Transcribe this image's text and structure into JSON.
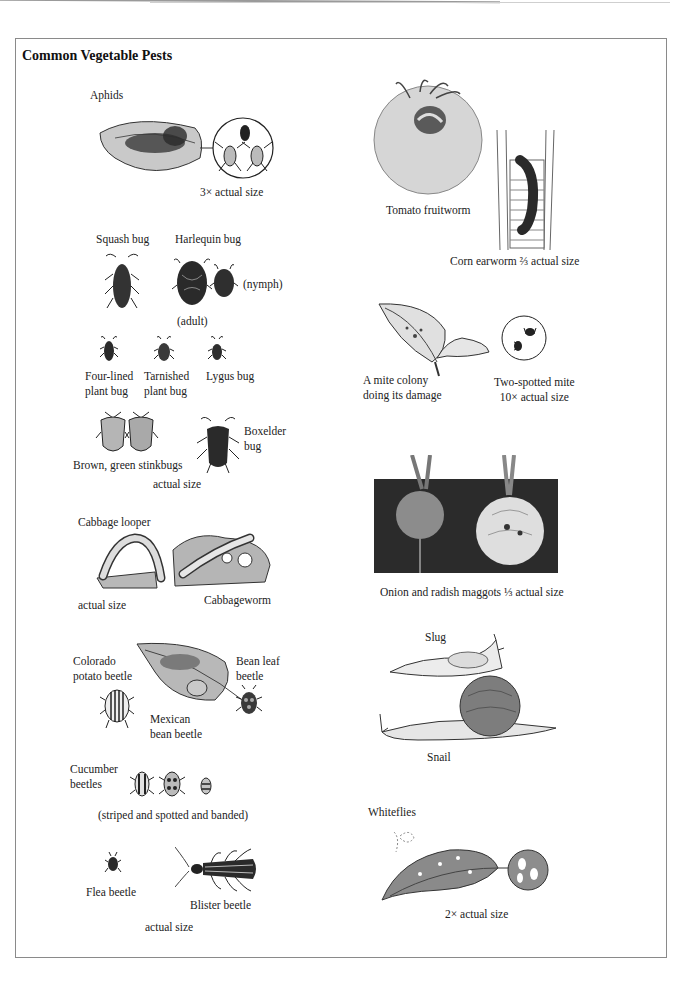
{
  "page": {
    "title": "Common Vegetable Pests"
  },
  "left_column": {
    "aphids": {
      "name": "Aphids",
      "scale": "3× actual size"
    },
    "bugs": {
      "squash_bug": "Squash bug",
      "harlequin_bug": "Harlequin bug",
      "nymph": "(nymph)",
      "adult": "(adult)",
      "four_lined_line1": "Four-lined",
      "four_lined_line2": "plant bug",
      "tarnished_line1": "Tarnished",
      "tarnished_line2": "plant bug",
      "lygus_bug": "Lygus bug",
      "boxelder_line1": "Boxelder",
      "boxelder_line2": "bug",
      "stinkbugs": "Brown, green stinkbugs",
      "scale": "actual size"
    },
    "caterpillars": {
      "cabbage_looper": "Cabbage looper",
      "scale": "actual size",
      "cabbageworm": "Cabbageworm"
    },
    "beetles": {
      "colorado_line1": "Colorado",
      "colorado_line2": "potato beetle",
      "bean_leaf_line1": "Bean leaf",
      "bean_leaf_line2": "beetle",
      "mexican_line1": "Mexican",
      "mexican_line2": "bean beetle",
      "cucumber_line1": "Cucumber",
      "cucumber_line2": "beetles",
      "cucumber_note": "(striped and spotted and banded)",
      "flea_beetle": "Flea beetle",
      "blister_beetle": "Blister beetle",
      "scale": "actual size"
    }
  },
  "right_column": {
    "tomato_fruitworm": "Tomato fruitworm",
    "corn_earworm": "Corn earworm ⅔ actual size",
    "mite_colony_line1": "A mite colony",
    "mite_colony_line2": "doing its damage",
    "two_spotted_line1": "Two-spotted mite",
    "two_spotted_line2": "10× actual size",
    "maggots": "Onion and radish maggots ⅓ actual size",
    "slug": "Slug",
    "snail": "Snail",
    "whiteflies": "Whiteflies",
    "whiteflies_scale": "2× actual size"
  },
  "colors": {
    "ink": "#1e1e1e",
    "frame": "#8a8a8a",
    "tomato_fill": "#d8d8d8",
    "leaf_fill": "#bdbdbd",
    "soil_fill": "#2b2b2b"
  }
}
